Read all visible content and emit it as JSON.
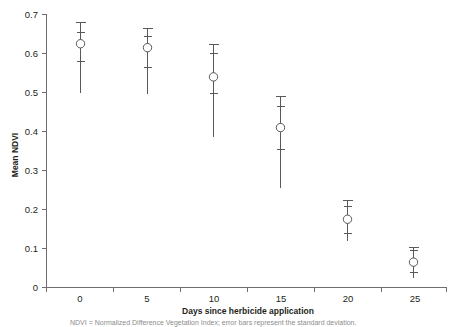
{
  "chart_data": {
    "type": "scatter",
    "title": "",
    "xlabel": "Days since herbicide application",
    "ylabel": "Mean NDVI",
    "x": [
      0,
      5,
      10,
      15,
      20,
      25
    ],
    "values": [
      0.625,
      0.615,
      0.54,
      0.41,
      0.175,
      0.065
    ],
    "series": [
      {
        "name": "Mean NDVI",
        "values": [
          0.625,
          0.615,
          0.54,
          0.41,
          0.175,
          0.065
        ],
        "error_outer_upper": [
          0.68,
          0.665,
          0.625,
          0.49,
          0.225,
          0.105
        ],
        "error_outer_lower": [
          0.5,
          0.495,
          0.385,
          0.255,
          0.12,
          0.025
        ],
        "error_inner_upper": [
          0.655,
          0.645,
          0.6,
          0.465,
          0.21,
          0.095
        ],
        "error_inner_lower": [
          0.58,
          0.565,
          0.5,
          0.355,
          0.14,
          0.04
        ]
      }
    ],
    "xlim": [
      -2.5,
      27.5
    ],
    "ylim": [
      0,
      0.7
    ],
    "xticks": [
      0,
      5,
      10,
      15,
      20,
      25
    ],
    "xtick_labels": [
      "0",
      "5",
      "10",
      "15",
      "20",
      "25"
    ],
    "yticks": [
      0,
      0.1,
      0.2,
      0.3,
      0.4,
      0.5,
      0.6,
      0.7
    ],
    "ytick_labels": [
      "0",
      "0.1",
      "0.2",
      "0.3",
      "0.4",
      "0.5",
      "0.6",
      "0.7"
    ],
    "grid": false,
    "legend": "none",
    "marker": "open-circle",
    "colors": {
      "axis": "#6d6e71",
      "marker_stroke": "#58595b",
      "marker_fill": "#ffffff",
      "error_bar": "#58595b",
      "text": "#231f20"
    }
  },
  "axes": {
    "y_title": "Mean NDVI",
    "x_title": "Days since herbicide application"
  },
  "caption": {
    "text": "NDVI = Normalized Difference Vegetation Index; error bars represent the standard deviation."
  }
}
